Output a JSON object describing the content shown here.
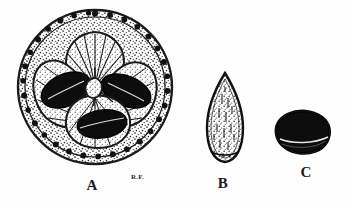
{
  "plate": {
    "background_color": "#fefefe",
    "ink_color": "#1b1b1b",
    "medium": "engraving",
    "subject": "fruit transverse section and seeds"
  },
  "figures": [
    {
      "key": "A",
      "label": "A",
      "name": "transverse-section-of-fruit",
      "shape": "circle",
      "description": "Transverse section of fruit showing four locules, three containing dark seeds and one empty, surrounded by stippled pulp and a rind bearing dark oil glands",
      "locule_count": 4,
      "seed_count": 3,
      "empty_locule_count": 1
    },
    {
      "key": "B",
      "label": "B",
      "name": "seed-lateral-view",
      "shape": "pointed-ovate",
      "description": "Seed in lateral view, pointed apex, finely stippled surface"
    },
    {
      "key": "C",
      "label": "C",
      "name": "seed-end-view",
      "shape": "rounded-polygon",
      "description": "Seed in end view, dark rounded polygonal outline with pale hilar line"
    }
  ],
  "signature": {
    "text": "R.F.",
    "name": "artist-initials"
  },
  "colors": {
    "ink": "#1b1b1b",
    "seed_dark": "#0d0d0d",
    "pulp_mid": "#6e6e6e",
    "paper": "#fefefe"
  }
}
